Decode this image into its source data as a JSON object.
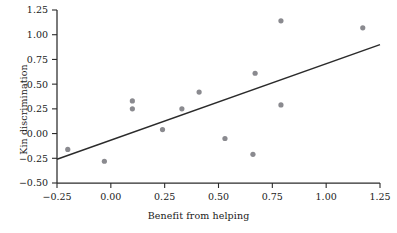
{
  "chart_data": {
    "type": "scatter",
    "title": "",
    "xlabel": "Benefit from helping",
    "ylabel": "Kin discrimination",
    "xlim": [
      -0.25,
      1.25
    ],
    "ylim": [
      -0.5,
      1.25
    ],
    "xticks": [
      -0.25,
      0.0,
      0.25,
      0.5,
      0.75,
      1.0,
      1.25
    ],
    "xticklabels": [
      "−0.25",
      "0.00",
      "0.25",
      "0.50",
      "0.75",
      "1.00",
      "1.25"
    ],
    "yticks": [
      -0.5,
      -0.25,
      0.0,
      0.25,
      0.5,
      0.75,
      1.0,
      1.25
    ],
    "yticklabels": [
      "−0.50",
      "−0.25",
      "0.00",
      "0.25",
      "0.50",
      "0.75",
      "1.00",
      "1.25"
    ],
    "grid": false,
    "legend": null,
    "marker_color": "#8a8a8f",
    "line_color": "#2b2b2b",
    "points": [
      {
        "x": -0.2,
        "y": -0.16
      },
      {
        "x": -0.03,
        "y": -0.28
      },
      {
        "x": 0.1,
        "y": 0.33
      },
      {
        "x": 0.1,
        "y": 0.25
      },
      {
        "x": 0.24,
        "y": 0.04
      },
      {
        "x": 0.33,
        "y": 0.25
      },
      {
        "x": 0.41,
        "y": 0.42
      },
      {
        "x": 0.53,
        "y": -0.05
      },
      {
        "x": 0.66,
        "y": -0.21
      },
      {
        "x": 0.67,
        "y": 0.61
      },
      {
        "x": 0.79,
        "y": 1.14
      },
      {
        "x": 0.79,
        "y": 0.29
      },
      {
        "x": 1.17,
        "y": 1.07
      }
    ],
    "fit_line": {
      "type": "linear-regression",
      "x_start": -0.25,
      "y_start": -0.26,
      "x_end": 1.25,
      "y_end": 0.9
    }
  }
}
